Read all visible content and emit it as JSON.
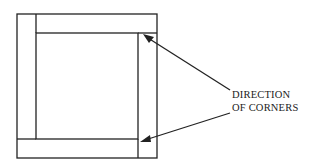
{
  "diagram": {
    "label_line1": "DIRECTION",
    "label_line2": "OF CORNERS",
    "stroke_color": "#222222",
    "background": "#ffffff"
  }
}
